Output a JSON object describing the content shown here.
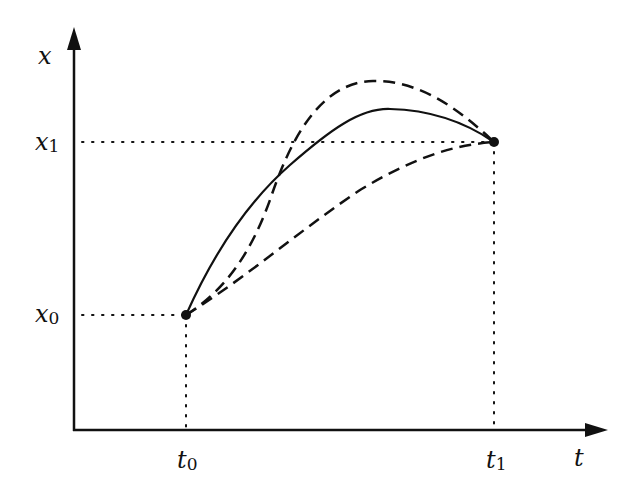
{
  "diagram": {
    "axes": {
      "vertical_label": "x",
      "horizontal_label": "t"
    },
    "points": {
      "start": {
        "t_label": "t",
        "t_sub": "0",
        "x_label": "x",
        "x_sub": "0"
      },
      "end": {
        "t_label": "t",
        "t_sub": "1",
        "x_label": "x",
        "x_sub": "1"
      }
    },
    "curves": [
      {
        "name": "solid-curve",
        "style": "solid"
      },
      {
        "name": "upper-dashed-curve",
        "style": "dashed"
      },
      {
        "name": "lower-dashed-curve",
        "style": "dashed"
      }
    ],
    "colors": {
      "ink": "#111111",
      "background": "#ffffff"
    }
  }
}
